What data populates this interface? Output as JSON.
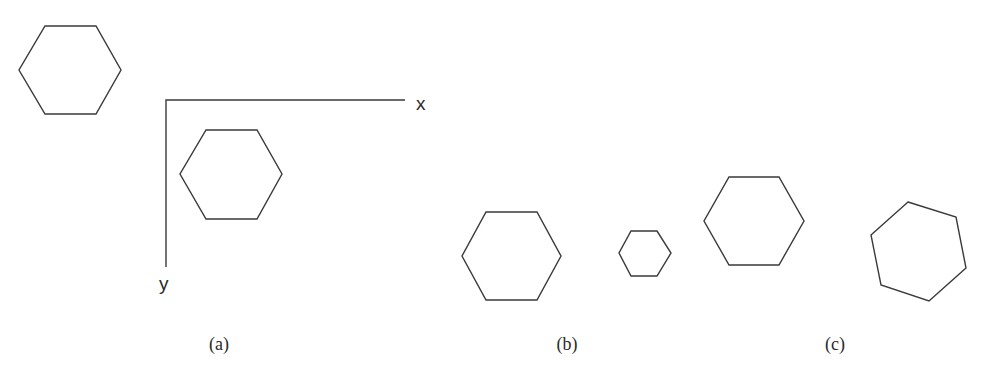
{
  "figure": {
    "stroke_color": "#3a3a3a",
    "background": "#ffffff"
  },
  "panels": [
    {
      "id": "a",
      "label": "(a)",
      "axes": {
        "x_label": "x",
        "y_label": "y",
        "origin": [
          166,
          100
        ],
        "x_end": [
          405,
          100
        ],
        "y_end": [
          166,
          267
        ]
      },
      "shapes": [
        {
          "name": "original-hexagon",
          "points": "45,26 96,26 121,70 96,114 45,114 19,70"
        },
        {
          "name": "translated-hexagon",
          "points": "206,130 257,130 282,174 257,219 206,219 180,174"
        }
      ]
    },
    {
      "id": "b",
      "label": "(b)",
      "shapes": [
        {
          "name": "large-hexagon",
          "points": "486,212 537,212 561,256 537,300 486,300 462,256"
        },
        {
          "name": "scaled-small-hexagon",
          "points": "631,231 657,231 671,253 657,276 631,276 619,253"
        }
      ]
    },
    {
      "id": "c",
      "label": "(c)",
      "shapes": [
        {
          "name": "unrotated-hexagon",
          "points": "729,177 779,177 804,221 779,265 729,265 704,221"
        },
        {
          "name": "rotated-hexagon",
          "points": "908,202 956,217 966,268 929,301 881,285 871,235"
        }
      ]
    }
  ]
}
